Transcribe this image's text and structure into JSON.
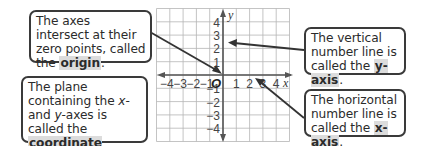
{
  "diagram": {
    "grid": {
      "x_range": [
        -5,
        5
      ],
      "y_range": [
        -5,
        5
      ],
      "x_ticks": [
        "-4",
        "-3",
        "-2",
        "-1",
        "1",
        "2",
        "3",
        "4"
      ],
      "y_ticks": [
        "4",
        "3",
        "2",
        "1",
        "-1",
        "-2",
        "-3",
        "-4"
      ],
      "x_axis_label": "x",
      "y_axis_label": "y",
      "origin_label": "O"
    },
    "callouts": {
      "origin": {
        "text_before": "The axes intersect at their zero points, called the ",
        "term": "origin",
        "text_after": "."
      },
      "plane": {
        "text_1": "The plane containing the ",
        "var_x": "x",
        "text_2": "- and ",
        "var_y": "y",
        "text_3": "-axes is called the ",
        "term": "coordinate plane",
        "text_after": "."
      },
      "yaxis": {
        "text_before": "The vertical number line is called the ",
        "term": "y-axis",
        "text_after": "."
      },
      "xaxis": {
        "text_before": "The horizontal number line is called the ",
        "term": "x-axis",
        "text_after": "."
      }
    },
    "colors": {
      "grid": "#b5b5b5",
      "axis": "#555555",
      "pointer": "#333333",
      "term_highlight": "#dcdcdc"
    }
  }
}
